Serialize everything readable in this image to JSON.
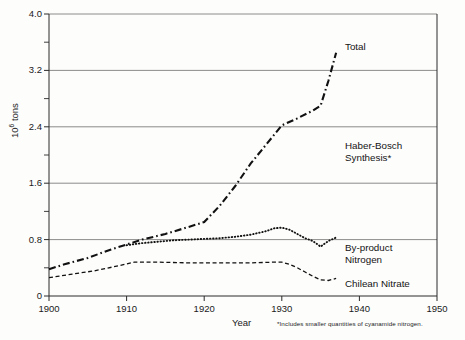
{
  "chart_data": {
    "type": "line",
    "title": "",
    "xlabel": "Year",
    "ylabel": "10⁶ tons",
    "xlim": [
      1900,
      1950
    ],
    "ylim": [
      0,
      4.0
    ],
    "grid": "horizontal major gridlines",
    "legend": "inline series annotations at right of plot",
    "x_ticks": [
      "1900",
      "1910",
      "1920",
      "1930",
      "1940",
      "1950"
    ],
    "x_tick_values": [
      1900,
      1910,
      1920,
      1930,
      1940,
      1950
    ],
    "y_ticks": [
      "0",
      "0.8",
      "1.6",
      "2.4",
      "3.2",
      "4.0"
    ],
    "y_tick_values": [
      0,
      0.8,
      1.6,
      2.4,
      3.2,
      4.0
    ],
    "y_minor_tick_values": [
      0.4,
      1.2,
      2.0,
      2.8,
      3.6
    ],
    "series": [
      {
        "name": "Total",
        "style": "dash-dot",
        "x": [
          1900,
          1902,
          1905,
          1908,
          1910,
          1912,
          1915,
          1918,
          1920,
          1922,
          1924,
          1926,
          1928,
          1930,
          1932,
          1934,
          1935,
          1936,
          1937
        ],
        "values": [
          0.38,
          0.45,
          0.54,
          0.66,
          0.73,
          0.8,
          0.88,
          0.98,
          1.05,
          1.28,
          1.56,
          1.88,
          2.15,
          2.42,
          2.52,
          2.63,
          2.7,
          3.05,
          3.45
        ]
      },
      {
        "name": "By-product Nitrogen",
        "style": "dotted",
        "x": [
          1910,
          1912,
          1914,
          1916,
          1918,
          1920,
          1922,
          1924,
          1926,
          1928,
          1929,
          1930,
          1931,
          1932,
          1933,
          1934,
          1935,
          1936,
          1937
        ],
        "values": [
          0.72,
          0.75,
          0.77,
          0.79,
          0.8,
          0.81,
          0.82,
          0.84,
          0.87,
          0.92,
          0.96,
          0.97,
          0.94,
          0.88,
          0.82,
          0.78,
          0.7,
          0.78,
          0.83
        ]
      },
      {
        "name": "Chilean Nitrate",
        "style": "dashed",
        "x": [
          1900,
          1903,
          1906,
          1909,
          1911,
          1914,
          1918,
          1922,
          1926,
          1929,
          1930,
          1931,
          1932,
          1933,
          1934,
          1935,
          1936,
          1937
        ],
        "values": [
          0.26,
          0.31,
          0.36,
          0.43,
          0.48,
          0.48,
          0.47,
          0.47,
          0.47,
          0.48,
          0.48,
          0.45,
          0.4,
          0.34,
          0.28,
          0.23,
          0.22,
          0.25
        ]
      }
    ],
    "annotations": [
      {
        "label": "Total",
        "x": 1937,
        "y": 3.6
      },
      {
        "label": "Haber-Bosch Synthesis*",
        "x": 1938,
        "y": 2.1
      },
      {
        "label": "By-product Nitrogen",
        "x": 1938,
        "y": 0.62
      },
      {
        "label": "Chilean Nitrate",
        "x": 1938,
        "y": 0.18
      }
    ],
    "footnote": "*Includes smaller quantities of cyanamide nitrogen."
  },
  "axes": {
    "y_title_prefix": "10",
    "y_title_exponent": "6",
    "y_title_suffix": " tons",
    "x_title": "Year"
  },
  "annotations": {
    "total": "Total",
    "haber_bosch_line1": "Haber-Bosch",
    "haber_bosch_line2": "Synthesis*",
    "byproduct_line1": "By-product",
    "byproduct_line2": "Nitrogen",
    "chilean": "Chilean Nitrate"
  },
  "footnote": {
    "text": "*Includes smaller quantities of cyanamide nitrogen."
  },
  "colors": {
    "axis": "#2b2b2b",
    "grid": "#6f6f6f",
    "series": "#111111",
    "background": "#fdfdfc"
  }
}
